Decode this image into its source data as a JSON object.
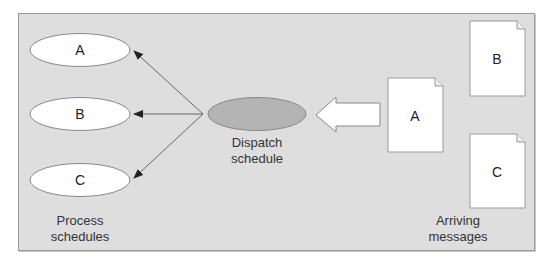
{
  "diagram": {
    "title": "",
    "colors": {
      "background": "#dedede",
      "frame_border": "#9a9a9a",
      "node_fill": "#ffffff",
      "dispatch_fill": "#b4b4b4",
      "stroke": "#777777",
      "arrow": "#555555",
      "text": "#222222"
    },
    "process_schedules": {
      "nodes": [
        {
          "id": "A",
          "label": "A"
        },
        {
          "id": "B",
          "label": "B"
        },
        {
          "id": "C",
          "label": "C"
        }
      ],
      "caption_line1": "Process",
      "caption_line2": "schedules"
    },
    "dispatch": {
      "caption_line1": "Dispatch",
      "caption_line2": "schedule"
    },
    "arriving_messages": {
      "documents": [
        {
          "id": "A",
          "label": "A"
        },
        {
          "id": "B",
          "label": "B"
        },
        {
          "id": "C",
          "label": "C"
        }
      ],
      "caption_line1": "Arriving",
      "caption_line2": "messages"
    },
    "edges": [
      {
        "from": "dispatch",
        "to": "process-A"
      },
      {
        "from": "dispatch",
        "to": "process-B"
      },
      {
        "from": "dispatch",
        "to": "process-C"
      },
      {
        "from": "message-A",
        "to": "dispatch",
        "style": "block-arrow"
      }
    ]
  }
}
